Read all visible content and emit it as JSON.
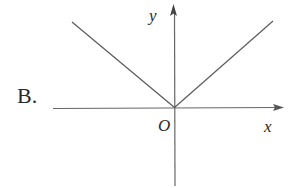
{
  "option_label": "B.",
  "axes": {
    "x_label": "x",
    "y_label": "y",
    "origin_label": "O"
  },
  "colors": {
    "line": "#555555",
    "axis": "#666666",
    "text": "#2a2a2a",
    "background": "#ffffff"
  },
  "graph": {
    "description": "V-shaped graph with vertex at origin, lines extending up-left and up-right (y = |kx|)",
    "left_branch": {
      "from": [
        -1.0,
        0.85
      ],
      "to": [
        0,
        0
      ]
    },
    "right_branch": {
      "from": [
        0,
        0
      ],
      "to": [
        1.0,
        0.87
      ]
    }
  }
}
